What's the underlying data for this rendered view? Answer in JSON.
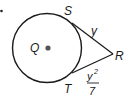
{
  "diagram": {
    "type": "circle-tangent-segments",
    "circle": {
      "center_label": "Q"
    },
    "points": {
      "S": "S",
      "T": "T",
      "R": "R"
    },
    "segments": {
      "SR": {
        "label": "y"
      },
      "TR": {
        "numerator": "y",
        "exponent": "2",
        "denominator": "7"
      }
    }
  }
}
